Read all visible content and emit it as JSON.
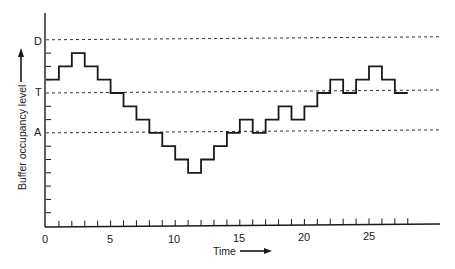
{
  "chart_data": {
    "type": "line",
    "subtype": "step",
    "title": "",
    "xlabel": "Time",
    "ylabel": "Buffer occupancy level",
    "x_ticks_labeled": [
      0,
      5,
      10,
      15,
      20,
      25
    ],
    "x_minor_ticks": [
      1,
      2,
      3,
      4,
      5,
      6,
      7,
      8,
      9,
      10,
      11,
      12,
      13,
      14,
      15,
      16,
      17,
      18,
      19,
      20,
      21,
      22,
      23,
      24,
      25,
      26,
      27,
      28
    ],
    "xlim": [
      0,
      30
    ],
    "y_unit_ticks": [
      1,
      2,
      3,
      4,
      5,
      6,
      7,
      8,
      9,
      10,
      11,
      12,
      13,
      14
    ],
    "ylim": [
      0,
      16
    ],
    "grid": false,
    "reference_lines": [
      {
        "label": "D",
        "y": 14,
        "style": "dashed"
      },
      {
        "label": "T",
        "y": 10,
        "style": "dashed"
      },
      {
        "label": "A",
        "y": 7,
        "style": "dashed"
      }
    ],
    "series": [
      {
        "name": "Buffer occupancy",
        "x": [
          0,
          1,
          2,
          3,
          4,
          5,
          6,
          7,
          8,
          9,
          10,
          11,
          12,
          13,
          14,
          15,
          16,
          17,
          18,
          19,
          20,
          21,
          22,
          23,
          24,
          25,
          26,
          27
        ],
        "values": [
          11,
          12,
          13,
          12,
          11,
          10,
          9,
          8,
          7,
          6,
          5,
          4,
          5,
          6,
          7,
          8,
          7,
          8,
          9,
          8,
          9,
          10,
          11,
          10,
          11,
          12,
          11,
          10
        ]
      }
    ],
    "legend": null
  },
  "labels": {
    "xlabel": "Time",
    "ylabel": "Buffer occupancy level",
    "x0": "0",
    "x5": "5",
    "x10": "10",
    "x15": "15",
    "x20": "20",
    "x25": "25",
    "D": "D",
    "T": "T",
    "A": "A"
  }
}
